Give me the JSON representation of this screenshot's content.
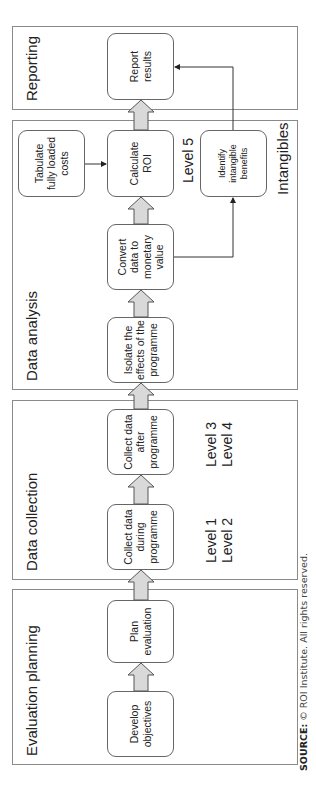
{
  "panels": {
    "evaluation_planning": "Evaluation planning",
    "data_collection": "Data collection",
    "data_analysis": "Data analysis",
    "reporting": "Reporting"
  },
  "nodes": {
    "develop_objectives": "Develop objectives",
    "plan_evaluation": "Plan evaluation",
    "collect_during": "Collect data during programme",
    "collect_after": "Collect data after programme",
    "isolate_effects": "Isolate the effects of the programme",
    "convert_monetary": "Convert data to monetary value",
    "calculate_roi": "Calculate ROI",
    "tabulate_costs": "Tabulate fully loaded costs",
    "identify_intangibles": "Identify intangible benefits",
    "report_results": "Report results"
  },
  "levels": {
    "level_1_2": "Level 1\nLevel 2",
    "level_3_4": "Level 3\nLevel 4",
    "level_5": "Level 5",
    "intangibles": "Intangibles"
  },
  "source": {
    "label": "SOURCE:",
    "text": " © ROI Institute. All rights reserved."
  },
  "colors": {
    "arrow_fill": "#d9d9d9",
    "border": "#8a8a8a"
  }
}
